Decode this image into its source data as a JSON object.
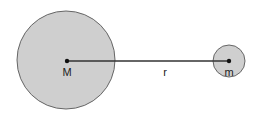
{
  "diagram": {
    "large_body": {
      "label": "M",
      "cx": 66,
      "cy": 60,
      "r": 49,
      "fill": "#cfcfcf",
      "stroke": "#666666"
    },
    "small_body": {
      "label": "m",
      "cx": 229,
      "cy": 61,
      "r": 16,
      "fill": "#cfcfcf",
      "stroke": "#666666"
    },
    "distance": {
      "label": "r",
      "color": "#333333"
    }
  }
}
